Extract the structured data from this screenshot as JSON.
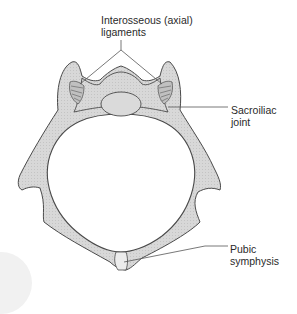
{
  "figure": {
    "colors": {
      "bone_fill": "#d6d6d6",
      "bone_stroke": "#4a4a4a",
      "ligament_fill": "#bdbdbd",
      "leader_line": "#555555",
      "text": "#2a2a2a",
      "background": "#ffffff"
    }
  },
  "labels": {
    "interosseous": {
      "line1": "Interosseous (axial)",
      "line2": "ligaments"
    },
    "sacroiliac": {
      "line1": "Sacroiliac",
      "line2": "joint"
    },
    "pubic": {
      "line1": "Pubic",
      "line2": "symphysis"
    }
  }
}
